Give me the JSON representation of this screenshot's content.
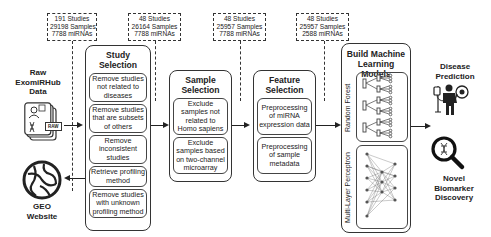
{
  "counts": [
    {
      "studies": "191 Studies",
      "samples": "29198 Samples",
      "mirnas": "7788 miRNAs"
    },
    {
      "studies": "48 Studies",
      "samples": "26164 Samples",
      "mirnas": "7788 miRNAs"
    },
    {
      "studies": "48 Studies",
      "samples": "25957 Samples",
      "mirnas": "7788 miRNAs"
    },
    {
      "studies": "48 Studies",
      "samples": "25957 Samples",
      "mirnas": "2588 miRNAs"
    }
  ],
  "source": {
    "title_line1": "Raw",
    "title_line2": "ExomiRHub",
    "title_line3": "Data",
    "badge": "RAW"
  },
  "geo": {
    "line1": "GEO",
    "line2": "Website"
  },
  "study_selection": {
    "title_line1": "Study",
    "title_line2": "Selection",
    "steps": [
      "Remove studies not related to diseases",
      "Remove studies that are subsets of others",
      "Remove inconsistent studies",
      "Retrieve profiling method",
      "Remove studies with unknown profiling method"
    ]
  },
  "sample_selection": {
    "title_line1": "Sample",
    "title_line2": "Selection",
    "steps": [
      "Exclude samples not related to Homo sapiens",
      "Exclude samples based on two-channel microarray"
    ]
  },
  "feature_selection": {
    "title_line1": "Feature",
    "title_line2": "Selection",
    "steps": [
      "Preprocessing of miRNA expression data",
      "Preprocessing of sample metadata"
    ]
  },
  "ml_models": {
    "title_line1": "Build Machine",
    "title_line2": "Learning Models",
    "models": [
      "Random Forest",
      "Multi-Layer Perceptron"
    ]
  },
  "outputs": {
    "disease_line1": "Disease",
    "disease_line2": "Prediction",
    "biomarker_line1": "Novel",
    "biomarker_line2": "Biomarker",
    "biomarker_line3": "Discovery"
  }
}
